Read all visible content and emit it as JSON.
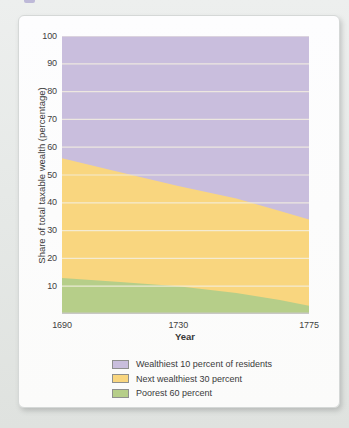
{
  "page": {
    "background_color": "#e6e9e7",
    "card_color": "#fcfcfd",
    "fragment_color": "#aaa3cf"
  },
  "chart_data": {
    "type": "area",
    "stacked": true,
    "title": "",
    "xlabel": "Year",
    "ylabel": "Share of total taxable wealth (percentage)",
    "xlim": [
      1690,
      1775
    ],
    "ylim": [
      0,
      100
    ],
    "x": [
      1690,
      1710,
      1730,
      1750,
      1765,
      1775
    ],
    "x_ticks": [
      "1690",
      "1730",
      "1775"
    ],
    "x_tick_values": [
      1690,
      1730,
      1775
    ],
    "y_ticks": [
      "10",
      "20",
      "30",
      "40",
      "50",
      "60",
      "70",
      "80",
      "90",
      "100"
    ],
    "y_tick_values": [
      10,
      20,
      30,
      40,
      50,
      60,
      70,
      80,
      90,
      100
    ],
    "grid": true,
    "gridline_color": "rgba(243,238,225,0.85)",
    "baseline_color": "#c8c8c4",
    "series": [
      {
        "name": "Poorest 60 percent",
        "color": "#b6ce89",
        "values": [
          13,
          11.5,
          10,
          7.5,
          5,
          3
        ]
      },
      {
        "name": "Next wealthiest 30 percent",
        "color": "#f9d67f",
        "values": [
          43,
          39.5,
          36,
          34,
          32,
          31
        ]
      },
      {
        "name": "Wealthiest 10 percent of residents",
        "color": "#c9bedd",
        "values": [
          44,
          49,
          54,
          58.5,
          63,
          66
        ]
      }
    ],
    "legend": {
      "position": "bottom",
      "items": [
        {
          "label": "Wealthiest 10 percent of residents",
          "color": "#c9bedd"
        },
        {
          "label": "Next wealthiest 30 percent",
          "color": "#f9d67f"
        },
        {
          "label": "Poorest 60 percent",
          "color": "#b6ce89"
        }
      ]
    }
  }
}
